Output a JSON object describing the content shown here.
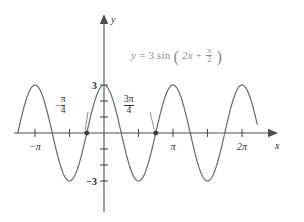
{
  "figure": {
    "title": "",
    "background": "#ffffff",
    "curve_color": "#6e6e6e",
    "axis_color": "#4d4d4d",
    "equation_color": "#8c8c8c",
    "label_color": "#2e2e2e"
  },
  "equation": {
    "lhs": "y",
    "equals": "=",
    "amplitude": "3",
    "function": "sin",
    "open_paren": "(",
    "inner_linear": "2x",
    "plus": "+",
    "phase_num": "π",
    "phase_den": "2",
    "close_paren": ")",
    "plain": "y = 3 sin (2x + π/2)"
  },
  "axes": {
    "x_label": "x",
    "y_label": "y",
    "x_ticks": [
      {
        "value": -1.0,
        "label": "−π",
        "show_label": true
      },
      {
        "value": -0.5,
        "label": "",
        "show_label": false
      },
      {
        "value": 0.5,
        "label": "",
        "show_label": false
      },
      {
        "value": 1.0,
        "label": "π",
        "show_label": true
      },
      {
        "value": 1.5,
        "label": "",
        "show_label": false
      },
      {
        "value": 2.0,
        "label": "2π",
        "show_label": true
      }
    ],
    "y_ticks": [
      {
        "value": 3,
        "label": "3",
        "show_label": true
      },
      {
        "value": 2,
        "label": "",
        "show_label": false
      },
      {
        "value": 1,
        "label": "",
        "show_label": false
      },
      {
        "value": -1,
        "label": "",
        "show_label": false
      },
      {
        "value": -2,
        "label": "",
        "show_label": false
      },
      {
        "value": -3,
        "label": "−3",
        "show_label": true
      }
    ],
    "xlim": [
      -1.42,
      2.42
    ],
    "ylim": [
      -4.1,
      4.1
    ],
    "grid": false
  },
  "callouts": [
    {
      "id": "neg-pi-4",
      "sign": "−",
      "num": "π",
      "den": "4",
      "plain": "−π/4",
      "point_x": -0.25,
      "point_y": 0
    },
    {
      "id": "3pi-4",
      "sign": "",
      "num": "3π",
      "den": "4",
      "plain": "3π/4",
      "point_x": 0.75,
      "point_y": 0
    }
  ],
  "chart_data": {
    "type": "line",
    "title": "",
    "xlabel": "x",
    "ylabel": "y",
    "legend": [],
    "grid": false,
    "x_units": "pi",
    "xlim": [
      -1.42,
      2.42
    ],
    "ylim": [
      -4.1,
      4.1
    ],
    "series": [
      {
        "name": "y = 3 sin (2x + π/2)",
        "formula": "3*sin(2*x + pi/2)",
        "amplitude": 3,
        "period_in_pi": 1.0,
        "phase_shift_in_pi": -0.25,
        "color": "#6e6e6e",
        "x_start_in_pi": -1.25,
        "x_end_in_pi": 2.22,
        "samples": 420,
        "key_points": [
          {
            "x_in_pi": -1.25,
            "y": 0,
            "type": "zero-rising"
          },
          {
            "x_in_pi": -1.0,
            "y": 3,
            "type": "maximum"
          },
          {
            "x_in_pi": -0.75,
            "y": 0,
            "type": "zero-falling"
          },
          {
            "x_in_pi": -0.5,
            "y": -3,
            "type": "minimum"
          },
          {
            "x_in_pi": -0.25,
            "y": 0,
            "type": "zero-rising"
          },
          {
            "x_in_pi": 0.0,
            "y": 3,
            "type": "maximum"
          },
          {
            "x_in_pi": 0.25,
            "y": 0,
            "type": "zero-falling"
          },
          {
            "x_in_pi": 0.5,
            "y": -3,
            "type": "minimum"
          },
          {
            "x_in_pi": 0.75,
            "y": 0,
            "type": "zero-rising"
          },
          {
            "x_in_pi": 1.0,
            "y": 3,
            "type": "maximum"
          },
          {
            "x_in_pi": 1.25,
            "y": 0,
            "type": "zero-falling"
          },
          {
            "x_in_pi": 1.5,
            "y": -3,
            "type": "minimum"
          },
          {
            "x_in_pi": 1.75,
            "y": 0,
            "type": "zero-rising"
          },
          {
            "x_in_pi": 2.0,
            "y": 3,
            "type": "maximum"
          },
          {
            "x_in_pi": 2.22,
            "y": 1.5,
            "type": "endpoint"
          }
        ]
      }
    ],
    "marked_points": [
      {
        "x_in_pi": -0.25,
        "y": 0,
        "label": "−π/4"
      },
      {
        "x_in_pi": 0.75,
        "y": 0,
        "label": "3π/4"
      }
    ]
  }
}
